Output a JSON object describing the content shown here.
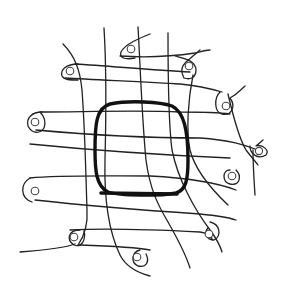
{
  "figure": {
    "title": "Mesh grid with looped anchor pins around central rounded frame",
    "colors": {
      "background": "#ffffff",
      "line": "#222222",
      "frame": "#111111"
    },
    "anchor_pins": [
      {
        "id": "pin-top-1",
        "x": 131,
        "y": 49
      },
      {
        "id": "pin-left-upper",
        "x": 70,
        "y": 71
      },
      {
        "id": "pin-right-top",
        "x": 189,
        "y": 66
      },
      {
        "id": "pin-left-mid",
        "x": 35,
        "y": 122
      },
      {
        "id": "pin-right-mid",
        "x": 226,
        "y": 106
      },
      {
        "id": "pin-right-far",
        "x": 260,
        "y": 153
      },
      {
        "id": "pin-right-low",
        "x": 233,
        "y": 174
      },
      {
        "id": "pin-left-low",
        "x": 35,
        "y": 191
      },
      {
        "id": "pin-bottom-left",
        "x": 73,
        "y": 237
      },
      {
        "id": "pin-bottom-right",
        "x": 209,
        "y": 234
      },
      {
        "id": "pin-bottom-mid",
        "x": 137,
        "y": 257
      }
    ],
    "central_frame": {
      "shape": "rounded-square",
      "x": 95,
      "y": 102,
      "width": 90,
      "height": 93
    }
  }
}
